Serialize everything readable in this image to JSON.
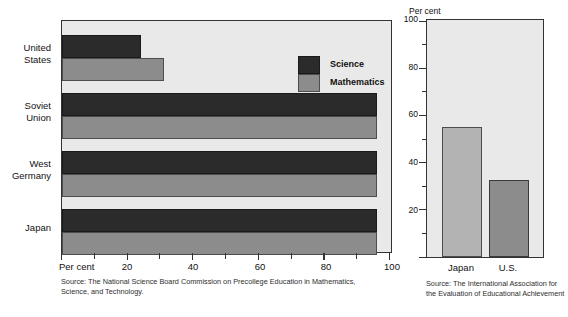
{
  "chart_data": [
    {
      "type": "bar",
      "orientation": "horizontal",
      "title": "",
      "xlabel": "Per cent",
      "ylabel": "",
      "xlim": [
        0,
        100
      ],
      "xticks": [
        0,
        10,
        20,
        30,
        40,
        50,
        60,
        70,
        80,
        90,
        100
      ],
      "xticklabels": [
        "",
        "",
        "20",
        "",
        "40",
        "",
        "60",
        "",
        "80",
        "",
        "100"
      ],
      "grid": false,
      "legend_position": "inside-top-right",
      "categories": [
        "United\nStates",
        "Soviet\nUnion",
        "West\nGermany",
        "Japan"
      ],
      "series": [
        {
          "name": "Science",
          "color": "#2b2b2b",
          "values": [
            24,
            96,
            96,
            96
          ]
        },
        {
          "name": "Mathematics",
          "color": "#8c8c8c",
          "values": [
            31,
            96,
            96,
            96
          ]
        }
      ],
      "source": "Source: The National Science Board Commission on Precollege Education in Mathematics, Science, and Technology."
    },
    {
      "type": "bar",
      "orientation": "vertical",
      "title": "",
      "xlabel": "",
      "ylabel": "Per cent",
      "ylim": [
        0,
        100
      ],
      "yticks": [
        0,
        10,
        20,
        30,
        40,
        50,
        60,
        70,
        80,
        90,
        100
      ],
      "yticklabels": [
        "",
        "",
        "20",
        "",
        "40",
        "",
        "60",
        "",
        "80",
        "",
        "100"
      ],
      "grid": false,
      "categories": [
        "Japan",
        "U.S."
      ],
      "values": [
        55,
        32.5
      ],
      "colors": [
        "#b3b3b3",
        "#8c8c8c"
      ],
      "source": "Source: The International Association for the Evaluation of Educational Achievement"
    }
  ],
  "left_chart": {
    "unit_label": "Per cent",
    "categories": [
      {
        "label": "United\nStates"
      },
      {
        "label": "Soviet\nUnion"
      },
      {
        "label": "West\nGermany"
      },
      {
        "label": "Japan"
      }
    ],
    "axis_labels": [
      "20",
      "40",
      "60",
      "80",
      "100"
    ],
    "legend": [
      {
        "label": "Science"
      },
      {
        "label": "Mathematics"
      }
    ],
    "source": "Source: The National Science Board Commission on Precollege Education in Mathematics, Science, and Technology."
  },
  "right_chart": {
    "unit_label": "Per cent",
    "y_labels": [
      "100",
      "80",
      "60",
      "40",
      "20"
    ],
    "categories": [
      {
        "label": "Japan"
      },
      {
        "label": "U.S."
      }
    ],
    "source": "Source: The International Association for the Evaluation of Educational Achievement"
  }
}
